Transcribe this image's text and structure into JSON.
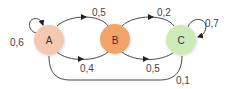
{
  "diagram": {
    "type": "markov-chain",
    "nodes": [
      {
        "id": "A",
        "label": "A",
        "color": "#f5c8b2",
        "cx": 49,
        "cy": 40
      },
      {
        "id": "B",
        "label": "B",
        "color": "#f2a36b",
        "cx": 115,
        "cy": 39
      },
      {
        "id": "C",
        "label": "C",
        "color": "#cdeab7",
        "cx": 181,
        "cy": 40
      }
    ],
    "edges": [
      {
        "from": "A",
        "to": "A",
        "label": "0,6"
      },
      {
        "from": "B",
        "to": "A",
        "label": "0,5"
      },
      {
        "from": "A",
        "to": "B",
        "label": "0,4"
      },
      {
        "from": "C",
        "to": "B",
        "label": "0,2"
      },
      {
        "from": "B",
        "to": "C",
        "label": "0,5"
      },
      {
        "from": "C",
        "to": "C",
        "label": "0,7"
      },
      {
        "from": "C",
        "to": "A",
        "label": "0,1"
      }
    ]
  }
}
